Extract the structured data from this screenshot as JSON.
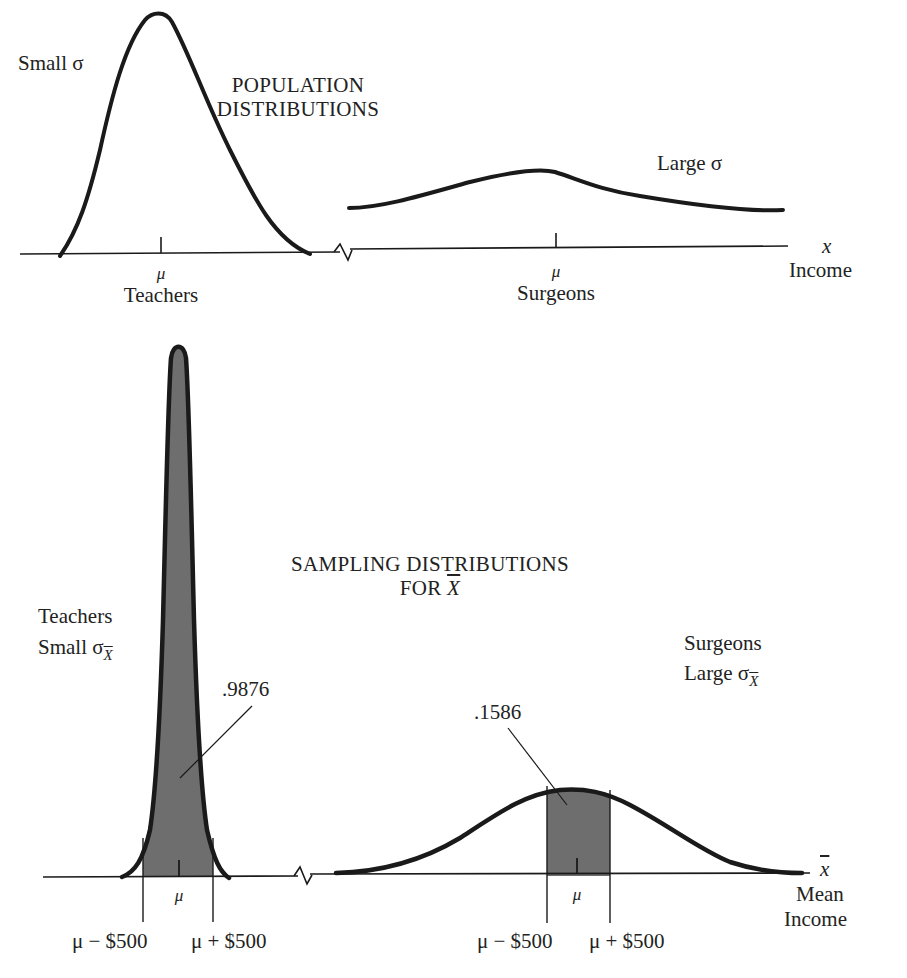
{
  "top_panel": {
    "title_line1": "POPULATION",
    "title_line2": "DISTRIBUTIONS",
    "teachers": {
      "sigma_label": "Small σ",
      "mu_label": "μ",
      "group_label": "Teachers"
    },
    "surgeons": {
      "sigma_label": "Large σ",
      "mu_label": "μ",
      "group_label": "Surgeons"
    },
    "x_axis": {
      "variable": "x",
      "label": "Income"
    }
  },
  "bottom_panel": {
    "title_line1": "SAMPLING DISTRIBUTIONS",
    "title_line2_prefix": "FOR ",
    "title_line2_var": "X",
    "teachers": {
      "group_label": "Teachers",
      "sigma_label": "Small σ",
      "sigma_sub": "X",
      "probability": ".9876",
      "mu_label": "μ",
      "lower_bound": "μ − $500",
      "upper_bound": "μ + $500"
    },
    "surgeons": {
      "group_label": "Surgeons",
      "sigma_label": "Large σ",
      "sigma_sub": "X",
      "probability": ".1586",
      "mu_label": "μ",
      "lower_bound": "μ − $500",
      "upper_bound": "μ + $500"
    },
    "x_axis": {
      "variable": "x",
      "label_line1": "Mean",
      "label_line2": "Income"
    }
  },
  "colors": {
    "ink": "#1a1a1a",
    "shade": "#6e6e6e",
    "background": "#ffffff"
  }
}
